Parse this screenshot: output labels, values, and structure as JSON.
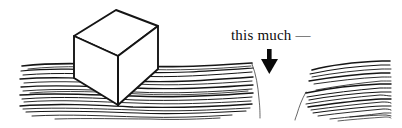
{
  "figure": {
    "background_color": "#ffffff",
    "ink_color": "#111111",
    "width": 402,
    "height": 128
  },
  "annotation": {
    "label": "this much —",
    "arrow_icon": "down-arrow-icon",
    "arrow_color": "#0a0a0a",
    "arrow_direction": "down"
  },
  "objects": {
    "cube": {
      "name": "floating-cube",
      "stroke_color": "#151515",
      "fill_color": "#ffffff",
      "vertices": {
        "top_left": [
          74,
          36
        ],
        "top_back": [
          116,
          10
        ],
        "top_right": [
          158,
          26
        ],
        "front_left": [
          74,
          78
        ],
        "front_bottom": [
          118,
          105
        ],
        "right_bottom": [
          158,
          69
        ]
      }
    },
    "water_left": {
      "name": "water-surface-left",
      "x_start": 20,
      "x_end": 254,
      "y_top": 62,
      "y_bottom": 119,
      "line_count": 17
    },
    "water_right": {
      "name": "water-surface-right",
      "x_start": 306,
      "x_end": 390,
      "y_top": 62,
      "y_bottom": 119,
      "line_count": 17
    },
    "gap": {
      "name": "water-displacement-gap",
      "x_center": 280,
      "width": 52,
      "description": "notch in water level"
    }
  }
}
